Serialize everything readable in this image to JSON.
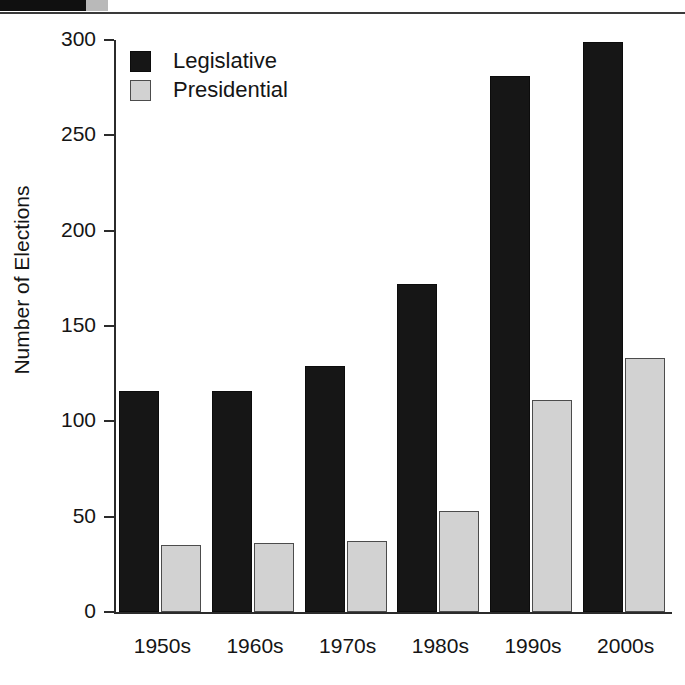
{
  "chart_data": {
    "type": "bar",
    "title": "",
    "subtitle": "",
    "xlabel": "",
    "ylabel": "Number of Elections",
    "categories": [
      "1950s",
      "1960s",
      "1970s",
      "1980s",
      "1990s",
      "2000s"
    ],
    "series": [
      {
        "name": "Legislative",
        "color": "#161616",
        "values": [
          115,
          115,
          128,
          171,
          280,
          298
        ]
      },
      {
        "name": "Presidential",
        "color": "#d2d2d2",
        "values": [
          34,
          35,
          36,
          52,
          110,
          132
        ]
      }
    ],
    "ylim": [
      0,
      300
    ],
    "ytick_labels": [
      "0",
      "50",
      "100",
      "150",
      "200",
      "250",
      "300"
    ],
    "ytick_values": [
      0,
      50,
      100,
      150,
      200,
      250,
      300
    ],
    "grid": false,
    "legend_position": "top-left"
  },
  "legend": {
    "items": [
      {
        "label": "Legislative"
      },
      {
        "label": "Presidential"
      }
    ]
  },
  "axes": {
    "y_title": "Number of Elections"
  }
}
